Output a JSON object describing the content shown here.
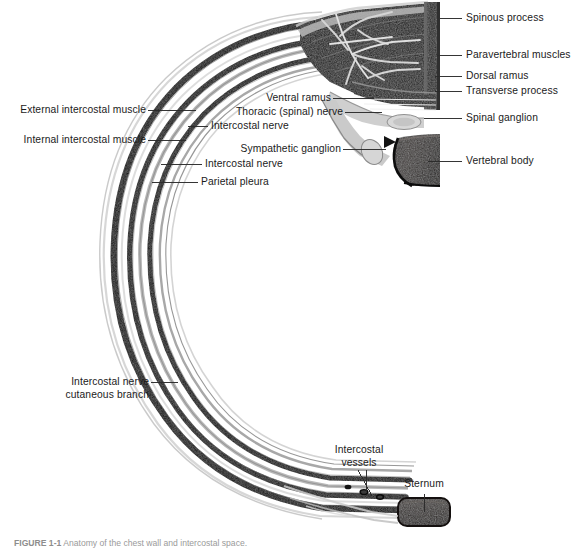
{
  "figure": {
    "title": "Anatomy of the chest wall",
    "type": "anatomical-cross-section",
    "colors": {
      "background": "#ffffff",
      "bone_dark": "#111111",
      "bone_mid": "#4a4a4a",
      "muscle_dark": "#080808",
      "nerve_light": "#cfcfcf",
      "pleura_gray": "#9a9a9a",
      "label_text": "#1b1b1b",
      "leader_line": "#2a2a2a",
      "caption_text": "#9a9a9a"
    }
  },
  "caption": {
    "prefix": "FIGURE 1-1",
    "text": "Anatomy of the chest wall and intercostal space."
  },
  "labels": [
    {
      "id": "spinous-process",
      "text": "Spinous process",
      "align": "left",
      "x": 466,
      "y": 12,
      "leader": {
        "x1": 440,
        "y1": 18,
        "x2": 462,
        "y2": 18
      }
    },
    {
      "id": "paravertebral-muscles",
      "text": "Paravertebral muscles",
      "align": "left",
      "x": 466,
      "y": 49,
      "leader": {
        "x1": 437,
        "y1": 55,
        "x2": 462,
        "y2": 55
      }
    },
    {
      "id": "dorsal-ramus",
      "text": "Dorsal ramus",
      "align": "left",
      "x": 466,
      "y": 70,
      "leader": {
        "x1": 435,
        "y1": 76,
        "x2": 462,
        "y2": 76
      }
    },
    {
      "id": "transverse-process",
      "text": "Transverse process",
      "align": "left",
      "x": 466,
      "y": 85,
      "leader": {
        "x1": 435,
        "y1": 91,
        "x2": 462,
        "y2": 91
      }
    },
    {
      "id": "spinal-ganglion",
      "text": "Spinal ganglion",
      "align": "left",
      "x": 466,
      "y": 112,
      "leader": {
        "x1": 425,
        "y1": 118,
        "x2": 462,
        "y2": 118
      }
    },
    {
      "id": "vertebral-body",
      "text": "Vertebral body",
      "align": "left",
      "x": 466,
      "y": 155,
      "leader": {
        "x1": 430,
        "y1": 161,
        "x2": 462,
        "y2": 161
      }
    },
    {
      "id": "external-intercostal-muscle",
      "text": "External intercostal muscle",
      "align": "right",
      "x": 8,
      "y": 104,
      "leader": {
        "x1": 148,
        "y1": 110,
        "x2": 196,
        "y2": 110
      }
    },
    {
      "id": "internal-intercostal-muscle",
      "text": "Internal intercostal muscle",
      "align": "right",
      "x": 8,
      "y": 134,
      "leader": {
        "x1": 148,
        "y1": 140,
        "x2": 186,
        "y2": 140
      }
    },
    {
      "id": "ventral-ramus",
      "text": "Ventral ramus",
      "align": "right",
      "x": 200,
      "y": 92,
      "leader": {
        "x1": 333,
        "y1": 98,
        "x2": 374,
        "y2": 98
      }
    },
    {
      "id": "thoracic-spinal-nerve",
      "text": "Thoracic (spinal) nerve",
      "align": "right",
      "x": 200,
      "y": 106,
      "leader": {
        "x1": 345,
        "y1": 112,
        "x2": 380,
        "y2": 112
      }
    },
    {
      "id": "intercostal-nerve-upper",
      "text": "Intercostal nerve",
      "align": "left",
      "x": 212,
      "y": 120,
      "leader": {
        "x1": 188,
        "y1": 126,
        "x2": 208,
        "y2": 126
      }
    },
    {
      "id": "sympathetic-ganglion",
      "text": "Sympathetic ganglion",
      "align": "right",
      "x": 228,
      "y": 143,
      "leader": {
        "x1": 343,
        "y1": 149,
        "x2": 388,
        "y2": 149
      }
    },
    {
      "id": "intercostal-nerve-lower",
      "text": "Intercostal nerve",
      "align": "left",
      "x": 206,
      "y": 158,
      "leader": {
        "x1": 161,
        "y1": 164,
        "x2": 202,
        "y2": 164
      }
    },
    {
      "id": "parietal-pleura",
      "text": "Parietal pleura",
      "align": "left",
      "x": 202,
      "y": 176,
      "leader": {
        "x1": 152,
        "y1": 182,
        "x2": 198,
        "y2": 182
      }
    },
    {
      "id": "intercostal-nerve-cutaneous-branch-1",
      "text": "Intercostal nerve",
      "align": "right",
      "x": 60,
      "y": 376,
      "leader": {
        "x1": 151,
        "y1": 382,
        "x2": 178,
        "y2": 382
      }
    },
    {
      "id": "intercostal-nerve-cutaneous-branch-2",
      "text": "cutaneous branch",
      "align": "right",
      "x": 60,
      "y": 389,
      "leader": null
    },
    {
      "id": "intercostal-vessels-1",
      "text": "Intercostal",
      "align": "center",
      "x": 358,
      "y": 450,
      "leader": null
    },
    {
      "id": "intercostal-vessels-2",
      "text": "vessels",
      "align": "center",
      "x": 358,
      "y": 463,
      "leader": null
    },
    {
      "id": "sternum",
      "text": "Sternum",
      "align": "center",
      "x": 424,
      "y": 482,
      "leader": {
        "x1": 424,
        "y1": 494,
        "x2": 424,
        "y2": 514
      }
    }
  ],
  "structures": [
    {
      "id": "vertebra-block",
      "name": "vertebral arch and spinous process"
    },
    {
      "id": "paravertebral-muscle-mass",
      "name": "paravertebral muscle mass"
    },
    {
      "id": "vertebral-body-block",
      "name": "vertebral body"
    },
    {
      "id": "rib-arc",
      "name": "rib with intercostal layers"
    },
    {
      "id": "sternum-block",
      "name": "sternum"
    },
    {
      "id": "nerve-plexus",
      "name": "dorsal ramus nerve plexus"
    },
    {
      "id": "intercostal-vessel-dots",
      "name": "intercostal vessels cross-section"
    }
  ]
}
